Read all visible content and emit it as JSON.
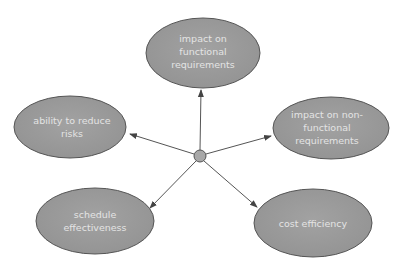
{
  "diagram": {
    "type": "hub-and-spoke",
    "colors": {
      "background": "#ffffff",
      "node_fill": "#9a9a9a",
      "node_stroke": "#555555",
      "node_text": "#e4e4e4",
      "connector": "#555555",
      "hub_fill": "#a8a8a8"
    },
    "hub": {
      "label": ""
    },
    "nodes": [
      {
        "id": "top",
        "lines": [
          "impact on",
          "functional",
          "requirements"
        ]
      },
      {
        "id": "left",
        "lines": [
          "ability to reduce",
          "risks"
        ]
      },
      {
        "id": "right",
        "lines": [
          "impact on non-",
          "functional",
          "requirements"
        ]
      },
      {
        "id": "bottom-left",
        "lines": [
          "schedule",
          "effectiveness"
        ]
      },
      {
        "id": "bottom-right",
        "lines": [
          "cost efficiency"
        ]
      }
    ]
  }
}
